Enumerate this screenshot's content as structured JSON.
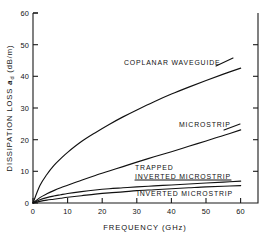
{
  "chart_data": {
    "type": "line",
    "title": "",
    "xlabel": "FREQUENCY (GHz)",
    "ylabel_prefix": "DISSIPATION LOSS ",
    "ylabel_symbol": "a",
    "ylabel_symbol_sub": "d",
    "ylabel_units": " (dB/m)",
    "ylabel_full": "DISSIPATION LOSS ad (dB/m)",
    "xlim": [
      0,
      65
    ],
    "ylim": [
      0,
      60
    ],
    "x_ticks": [
      0,
      10,
      20,
      30,
      40,
      50,
      60
    ],
    "x_tick_labels": [
      "0",
      "10",
      "20",
      "30",
      "40",
      "50",
      "60"
    ],
    "y_ticks": [
      0,
      10,
      20,
      30,
      40,
      50,
      60
    ],
    "y_tick_labels": [
      "0",
      "10",
      "20",
      "30",
      "40",
      "50",
      "60"
    ],
    "grid": false,
    "legend": "inline-annotations",
    "series": [
      {
        "name": "COPLANAR WAVEGUIDE",
        "label": "COPLANAR WAVEGUIDE",
        "x": [
          0,
          2,
          4,
          6,
          8,
          10,
          14,
          18,
          22,
          26,
          30,
          35,
          40,
          45,
          50,
          55,
          60
        ],
        "values": [
          0,
          5.5,
          9.0,
          11.8,
          14.0,
          16.0,
          19.4,
          22.2,
          24.8,
          27.2,
          29.4,
          32.0,
          34.4,
          36.6,
          38.7,
          40.7,
          42.6
        ]
      },
      {
        "name": "MICROSTRIP",
        "label": "MICROSTRIP",
        "x": [
          0,
          2,
          4,
          6,
          8,
          10,
          14,
          18,
          22,
          26,
          30,
          35,
          40,
          45,
          50,
          55,
          60
        ],
        "values": [
          0,
          1.7,
          2.9,
          3.9,
          4.8,
          5.6,
          7.2,
          8.7,
          10.1,
          11.5,
          12.9,
          14.6,
          16.2,
          17.9,
          19.6,
          21.3,
          23.1
        ]
      },
      {
        "name": "TRAPPED INVERTED MICROSTRIP",
        "label": "TRAPPED\nINVERTED MICROSTRIP",
        "label_line1": "TRAPPED",
        "label_line2": "INVERTED MICROSTRIP",
        "x": [
          0,
          2,
          4,
          6,
          8,
          10,
          14,
          18,
          22,
          26,
          30,
          35,
          40,
          45,
          50,
          55,
          60
        ],
        "values": [
          0,
          1.0,
          1.7,
          2.2,
          2.6,
          3.0,
          3.6,
          4.1,
          4.5,
          4.8,
          5.1,
          5.4,
          5.7,
          6.0,
          6.3,
          6.6,
          6.9
        ]
      },
      {
        "name": "INVERTED MICROSTRIP",
        "label": "INVERTED MICROSTRIP",
        "x": [
          0,
          2,
          4,
          6,
          8,
          10,
          14,
          18,
          22,
          26,
          30,
          35,
          40,
          45,
          50,
          55,
          60
        ],
        "values": [
          0,
          0.5,
          0.9,
          1.2,
          1.5,
          1.8,
          2.3,
          2.8,
          3.2,
          3.5,
          3.9,
          4.2,
          4.5,
          4.8,
          5.1,
          5.3,
          5.5
        ]
      }
    ],
    "annotations": [
      {
        "name": "coplanar-waveguide-label",
        "text": "COPLANAR WAVEGUIDE",
        "x_px": 124,
        "y_px": 65
      },
      {
        "name": "microstrip-label",
        "text": "MICROSTRIP",
        "x_px": 179,
        "y_px": 127
      },
      {
        "name": "trapped-inverted-microstrip-label-line1",
        "text": "TRAPPED",
        "x_px": 135,
        "y_px": 168
      },
      {
        "name": "trapped-inverted-microstrip-label-line2",
        "text": "INVERTED MICROSTRIP",
        "x_px": 135,
        "y_px": 177
      },
      {
        "name": "inverted-microstrip-label",
        "text": "INVERTED MICROSTRIP",
        "x_px": 137,
        "y_px": 195
      }
    ]
  }
}
